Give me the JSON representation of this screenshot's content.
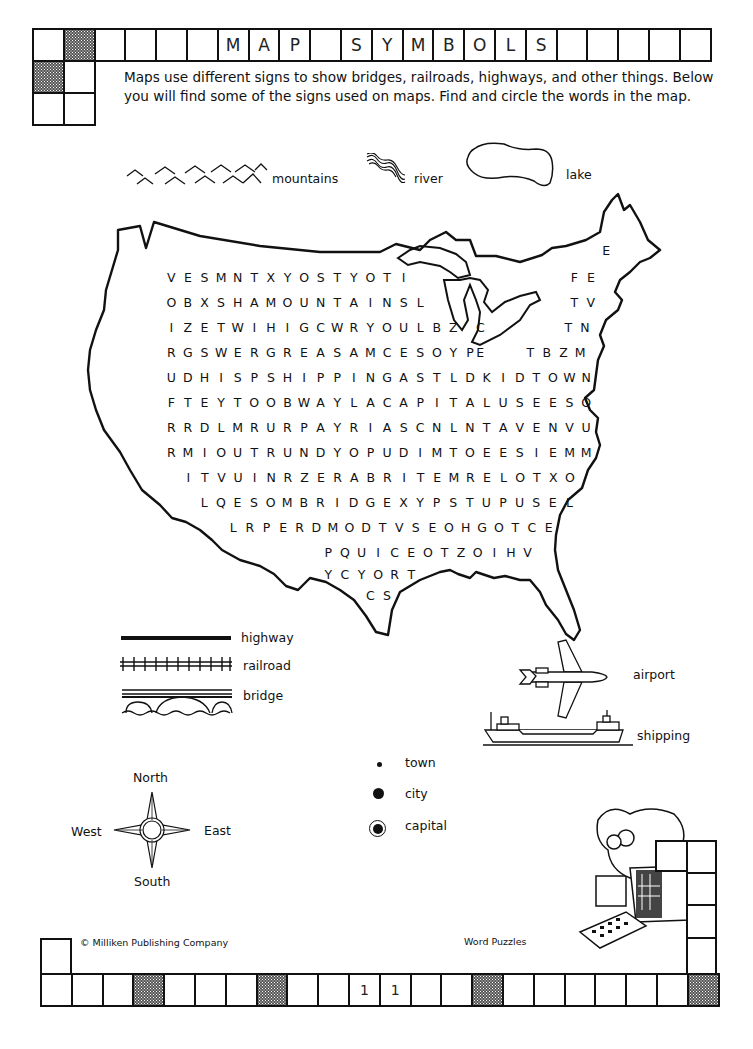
{
  "header": {
    "title_cells": [
      "",
      "",
      "",
      "",
      "",
      "",
      "M",
      "A",
      "P",
      "",
      "S",
      "Y",
      "M",
      "B",
      "O",
      "L",
      "S",
      "",
      "",
      "",
      "",
      ""
    ],
    "shaded_indices": [
      1
    ]
  },
  "intro": {
    "text": "Maps use different signs to show bridges, railroads, highways, and other things. Below you will find some of the signs used on maps. Find and circle the words in the map."
  },
  "top_symbols": {
    "mountains": "mountains",
    "river": "river",
    "lake": "lake"
  },
  "word_search": {
    "rows": [
      {
        "text": "E",
        "x": 598,
        "y": 251
      },
      {
        "text": "VESMNTXYOSTYOTI",
        "x": 163,
        "y": 278
      },
      {
        "text": "FE",
        "x": 566,
        "y": 278
      },
      {
        "text": "OBXSHAMOUNTAINSL",
        "x": 163,
        "y": 303
      },
      {
        "text": "TV",
        "x": 566,
        "y": 303
      },
      {
        "text": "IZETWIHIGCWRYOULBZ",
        "x": 163,
        "y": 328
      },
      {
        "text": "C",
        "x": 472,
        "y": 328
      },
      {
        "text": "TN",
        "x": 560,
        "y": 328
      },
      {
        "text": "RGSWERGREASAMCESOYP",
        "x": 163,
        "y": 353
      },
      {
        "text": "E",
        "x": 472,
        "y": 353
      },
      {
        "text": "TBZM",
        "x": 522,
        "y": 353
      },
      {
        "text": "UDHISPSHIPPINGASTLDKIDTOWN",
        "x": 163,
        "y": 378
      },
      {
        "text": "FTEYTOOBWAYLACAPITALUSEESO",
        "x": 163,
        "y": 403
      },
      {
        "text": "RRDLMRURPAYRIASCNLNTAVENVU",
        "x": 163,
        "y": 428
      },
      {
        "text": "RMIOUTRUNDYOPUDIMTOEESIEMM",
        "x": 163,
        "y": 453
      },
      {
        "text": "ITVUINRZERABRITEMRELOTXO",
        "x": 180,
        "y": 478
      },
      {
        "text": "LQESOMBRIDGEXYPSTUPUSEL",
        "x": 196,
        "y": 503
      },
      {
        "text": "LRPERDMODTVSEOHGOTCE",
        "x": 225,
        "y": 528
      },
      {
        "text": "PQUICEOTZOIHV",
        "x": 320,
        "y": 553
      },
      {
        "text": "YCYORT",
        "x": 320,
        "y": 575
      },
      {
        "text": "CS",
        "x": 362,
        "y": 596
      }
    ],
    "hidden_words": [
      "MOUNTAINS",
      "RIVER",
      "LAKE",
      "HIGHWAY",
      "RAILROAD",
      "BRIDGE",
      "AIRPORT",
      "SHIPPING",
      "TOWN",
      "CITY",
      "CAPITAL",
      "NORTH",
      "SOUTH",
      "EAST",
      "WEST"
    ]
  },
  "legend": {
    "highway": "highway",
    "railroad": "railroad",
    "bridge": "bridge",
    "airport": "airport",
    "shipping": "shipping",
    "town": "town",
    "city": "city",
    "capital": "capital"
  },
  "compass": {
    "north": "North",
    "south": "South",
    "east": "East",
    "west": "West"
  },
  "footer": {
    "copyright": "© Milliken Publishing Company",
    "series": "Word Puzzles",
    "page_cells": [
      "",
      "",
      "",
      "",
      "",
      "",
      "",
      "",
      "",
      "",
      "1",
      "1",
      "",
      "",
      "",
      "",
      "",
      "",
      "",
      "",
      "",
      ""
    ],
    "shaded_indices": [
      3,
      7,
      14,
      21
    ]
  }
}
